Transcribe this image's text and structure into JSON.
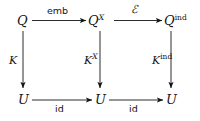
{
  "diagram": {
    "type": "commutative-square-grid",
    "grid": {
      "rows": 2,
      "cols": 3
    },
    "ink_color": "#141414",
    "background_color": "#ffffff",
    "nodes": [
      {
        "id": "n00",
        "base": "Q",
        "sup": "",
        "row": 0,
        "col": 0
      },
      {
        "id": "n01",
        "base": "Q",
        "sup": "X",
        "row": 0,
        "col": 1
      },
      {
        "id": "n02",
        "base": "Q",
        "sup": "ind",
        "row": 0,
        "col": 2
      },
      {
        "id": "n10",
        "base": "U",
        "sup": "",
        "row": 1,
        "col": 0
      },
      {
        "id": "n11",
        "base": "U",
        "sup": "",
        "row": 1,
        "col": 1
      },
      {
        "id": "n12",
        "base": "U",
        "sup": "",
        "row": 1,
        "col": 2
      }
    ],
    "edges": [
      {
        "id": "e-top-left",
        "from": "n00",
        "to": "n01",
        "label_base": "emb",
        "label_sup": "",
        "orientation": "horizontal"
      },
      {
        "id": "e-top-right",
        "from": "n01",
        "to": "n02",
        "label_base": "ℰ",
        "label_sup": "",
        "orientation": "horizontal"
      },
      {
        "id": "e-left-vert",
        "from": "n00",
        "to": "n10",
        "label_base": "K",
        "label_sup": "",
        "orientation": "vertical"
      },
      {
        "id": "e-middle-vert",
        "from": "n01",
        "to": "n11",
        "label_base": "K",
        "label_sup": "X",
        "orientation": "vertical"
      },
      {
        "id": "e-right-vert",
        "from": "n02",
        "to": "n12",
        "label_base": "K",
        "label_sup": "ind",
        "orientation": "vertical"
      },
      {
        "id": "e-bottom-left",
        "from": "n10",
        "to": "n11",
        "label_base": "id",
        "label_sup": "",
        "orientation": "horizontal"
      },
      {
        "id": "e-bottom-right",
        "from": "n11",
        "to": "n12",
        "label_base": "id",
        "label_sup": "",
        "orientation": "horizontal"
      }
    ]
  }
}
